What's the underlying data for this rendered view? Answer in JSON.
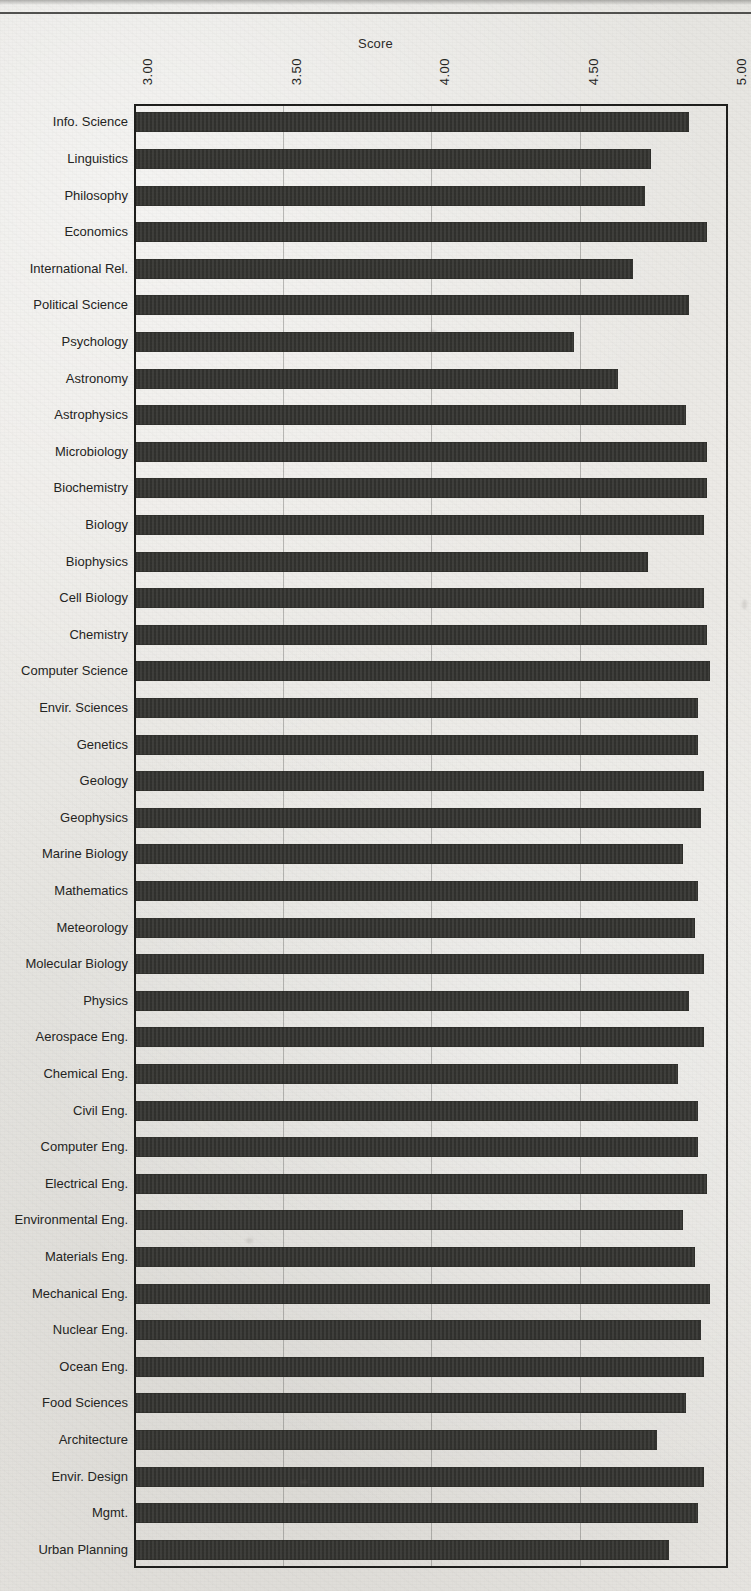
{
  "chart_data": {
    "type": "bar",
    "orientation": "horizontal",
    "title": "",
    "xlabel": "Score",
    "ylabel": "",
    "xlim": [
      3.0,
      5.0
    ],
    "xticks": [
      "3.00",
      "3.50",
      "4.00",
      "4.50",
      "5.00"
    ],
    "xtick_values": [
      3.0,
      3.5,
      4.0,
      4.5,
      5.0
    ],
    "grid": true,
    "legend": false,
    "tick_label_rotation": -90,
    "bar_color": "#33332f",
    "categories": [
      "Info. Science",
      "Linguistics",
      "Philosophy",
      "Economics",
      "International Rel.",
      "Political  Science",
      "Psychology",
      "Astronomy",
      "Astrophysics",
      "Microbiology",
      "Biochemistry",
      "Biology",
      "Biophysics",
      "Cell Biology",
      "Chemistry",
      "Computer Science",
      "Envir. Sciences",
      "Genetics",
      "Geology",
      "Geophysics",
      "Marine Biology",
      "Mathematics",
      "Meteorology",
      "Molecular Biology",
      "Physics",
      "Aerospace Eng.",
      "Chemical Eng.",
      "Civil Eng.",
      "Computer Eng.",
      "Electrical Eng.",
      "Environmental Eng.",
      "Materials  Eng.",
      "Mechanical Eng.",
      "Nuclear  Eng.",
      "Ocean Eng.",
      "Food Sciences",
      "Architecture",
      "Envir. Design",
      "Mgmt.",
      "Urban  Planning"
    ],
    "values": [
      4.87,
      4.74,
      4.72,
      4.93,
      4.68,
      4.87,
      4.48,
      4.63,
      4.86,
      4.93,
      4.93,
      4.92,
      4.73,
      4.92,
      4.93,
      4.94,
      4.9,
      4.9,
      4.92,
      4.91,
      4.85,
      4.9,
      4.89,
      4.92,
      4.87,
      4.92,
      4.83,
      4.9,
      4.9,
      4.93,
      4.85,
      4.89,
      4.94,
      4.91,
      4.92,
      4.86,
      4.76,
      4.92,
      4.9,
      4.8
    ]
  },
  "axis": {
    "title": "Score"
  }
}
